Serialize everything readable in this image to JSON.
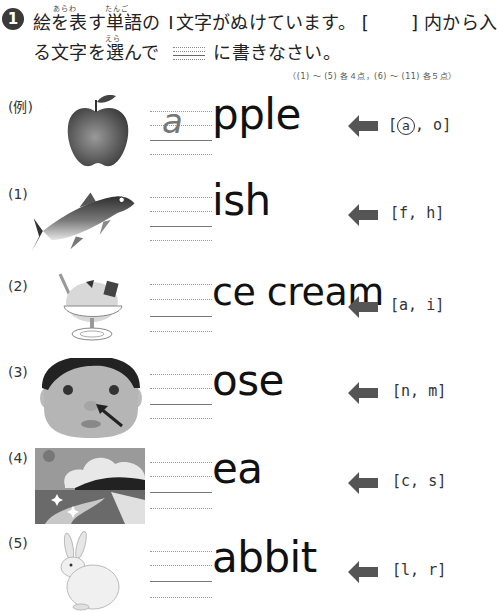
{
  "header": {
    "question_number": "1",
    "instruction_line1_part1": "絵を表す単語の",
    "instruction_line1_part2": "文字がぬけています。 [",
    "instruction_line1_part3": "] 内から入",
    "instruction_line1_digit": "I",
    "instruction_line2_part1": "る文字を選んで",
    "instruction_line2_part2": "に書きなさい。",
    "ruby": {
      "arawa": "あらわ",
      "tango": "たんご",
      "era": "えら"
    },
    "points": "（(1) ～ (5) 各４点，(6) ～ (11) 各５点）"
  },
  "rows": [
    {
      "label": "(例)",
      "picture": "apple-illustration",
      "answer": "a",
      "word": "pple",
      "choices_open": "[",
      "choice1": "a",
      "choice1_circled": true,
      "sep": ",",
      "choice2": "o",
      "choices_close": "]"
    },
    {
      "label": "(1)",
      "picture": "fish-illustration",
      "answer": "",
      "word": "ish",
      "choices_open": "[",
      "choice1": "f",
      "choice1_circled": false,
      "sep": ",",
      "choice2": "h",
      "choices_close": "]"
    },
    {
      "label": "(2)",
      "picture": "ice-cream-illustration",
      "answer": "",
      "word": "ce cream",
      "choices_open": "[",
      "choice1": "a",
      "choice1_circled": false,
      "sep": ",",
      "choice2": "i",
      "choices_close": "]"
    },
    {
      "label": "(3)",
      "picture": "face-nose-illustration",
      "answer": "",
      "word": "ose",
      "choices_open": "[",
      "choice1": "n",
      "choice1_circled": false,
      "sep": ",",
      "choice2": "m",
      "choices_close": "]"
    },
    {
      "label": "(4)",
      "picture": "sea-illustration",
      "answer": "",
      "word": "ea",
      "choices_open": "[",
      "choice1": "c",
      "choice1_circled": false,
      "sep": ",",
      "choice2": "s",
      "choices_close": "]"
    },
    {
      "label": "(5)",
      "picture": "rabbit-illustration",
      "answer": "",
      "word": "abbit",
      "choices_open": "[",
      "choice1": "l",
      "choice1_circled": false,
      "sep": ",",
      "choice2": "r",
      "choices_close": "]"
    }
  ],
  "colors": {
    "arrow": "#555555",
    "text": "#111111",
    "answer_gray": "#777777"
  }
}
